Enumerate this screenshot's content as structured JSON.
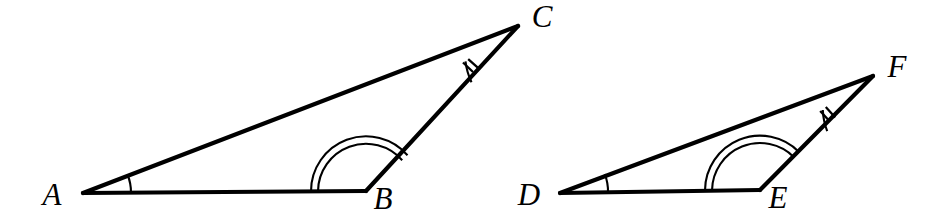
{
  "figure": {
    "background_color": "#ffffff",
    "stroke_color": "#000000",
    "label_color": "#000000"
  },
  "triangles": [
    {
      "name": "triangle-abc",
      "position": "left",
      "vertices": [
        {
          "label": "A",
          "x": 83,
          "y": 193,
          "label_x": 52,
          "label_y": 205,
          "mark": "single-arc"
        },
        {
          "label": "B",
          "x": 366,
          "y": 191,
          "label_x": 374,
          "label_y": 207,
          "mark": "double-arc"
        },
        {
          "label": "C",
          "x": 518,
          "y": 26,
          "label_x": 530,
          "label_y": 26,
          "mark": "double-tick"
        }
      ]
    },
    {
      "name": "triangle-def",
      "position": "right",
      "vertices": [
        {
          "label": "D",
          "x": 560,
          "y": 193,
          "label_x": 524,
          "label_y": 205,
          "mark": "single-arc"
        },
        {
          "label": "E",
          "x": 760,
          "y": 190,
          "label_x": 768,
          "label_y": 206,
          "mark": "double-arc"
        },
        {
          "label": "F",
          "x": 873,
          "y": 76,
          "label_x": 885,
          "label_y": 76,
          "mark": "double-tick"
        }
      ]
    }
  ],
  "angle_marks": {
    "single_arc_legend": "1 arc",
    "double_arc_legend": "2 arcs",
    "double_tick_legend": "2 ticks"
  }
}
